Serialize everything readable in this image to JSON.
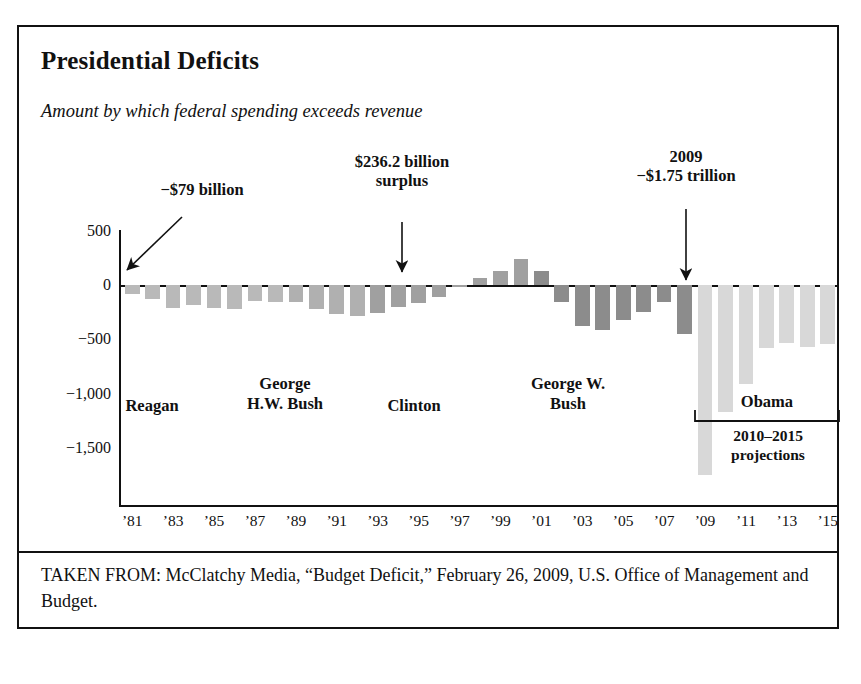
{
  "figure": {
    "title": "Presidential Deficits",
    "subtitle": "Amount by which federal spending exceeds revenue",
    "source": "TAKEN FROM: McClatchy Media, “Budget Deficit,” February 26, 2009, U.S. Office of Management and Budget."
  },
  "annotations": {
    "first_bar": "−$79 billion",
    "surplus": "$236.2 billion\nsurplus",
    "y2009": "2009\n−$1.75 trillion",
    "projection_note": "2010–2015\nprojections"
  },
  "eras": [
    {
      "label": "Reagan",
      "color": "#b9b9b9"
    },
    {
      "label": "George\nH.W. Bush",
      "color": "#b0b0b0"
    },
    {
      "label": "Clinton",
      "color": "#a0a0a0"
    },
    {
      "label": "George W.\nBush",
      "color": "#8c8c8c"
    },
    {
      "label": "Obama",
      "color": "#d8d8d8"
    }
  ],
  "chart_data": {
    "type": "bar",
    "title": "Presidential Deficits",
    "subtitle": "Amount by which federal spending exceeds revenue",
    "xlabel": "",
    "ylabel": "",
    "ylim": [
      -1800,
      620
    ],
    "yticks": [
      500,
      0,
      -500,
      -1000,
      -1500
    ],
    "ytick_labels": [
      "500",
      "0",
      "−500",
      "−1,000",
      "−1,500"
    ],
    "grid": false,
    "legend": false,
    "units": "billions of dollars",
    "categories": [
      "1981",
      "1982",
      "1983",
      "1984",
      "1985",
      "1986",
      "1987",
      "1988",
      "1989",
      "1990",
      "1991",
      "1992",
      "1993",
      "1994",
      "1995",
      "1996",
      "1997",
      "1998",
      "1999",
      "2000",
      "2001",
      "2002",
      "2003",
      "2004",
      "2005",
      "2006",
      "2007",
      "2008",
      "2009",
      "2010",
      "2011",
      "2012",
      "2013",
      "2014",
      "2015"
    ],
    "xtick_labels": [
      "’81",
      "’83",
      "’85",
      "’87",
      "’89",
      "’91",
      "’93",
      "’95",
      "’97",
      "’99",
      "’01",
      "’03",
      "’05",
      "’07",
      "’09",
      "’11",
      "’13",
      "’15"
    ],
    "values": [
      -79,
      -128,
      -208,
      -185,
      -212,
      -221,
      -150,
      -155,
      -153,
      -221,
      -269,
      -290,
      -255,
      -203,
      -164,
      -107,
      -22,
      69,
      126,
      236,
      128,
      -158,
      -378,
      -413,
      -318,
      -248,
      -161,
      -455,
      -1750,
      -1170,
      -912,
      -581,
      -533,
      -570,
      -546
    ],
    "series": [
      {
        "name": "Reagan",
        "range": [
          1981,
          1988
        ],
        "color": "#b9b9b9"
      },
      {
        "name": "George H.W. Bush",
        "range": [
          1989,
          1992
        ],
        "color": "#b0b0b0"
      },
      {
        "name": "Clinton",
        "range": [
          1993,
          2000
        ],
        "color": "#a0a0a0"
      },
      {
        "name": "George W. Bush",
        "range": [
          2001,
          2008
        ],
        "color": "#8c8c8c"
      },
      {
        "name": "Obama",
        "range": [
          2009,
          2015
        ],
        "color": "#d8d8d8"
      }
    ],
    "annotations": [
      {
        "text": "−$79 billion",
        "target": "1981",
        "value": -79
      },
      {
        "text": "$236.2 billion surplus",
        "target": "2000",
        "value": 236.2
      },
      {
        "text": "2009 −$1.75 trillion",
        "target": "2009",
        "value": -1750
      }
    ]
  }
}
